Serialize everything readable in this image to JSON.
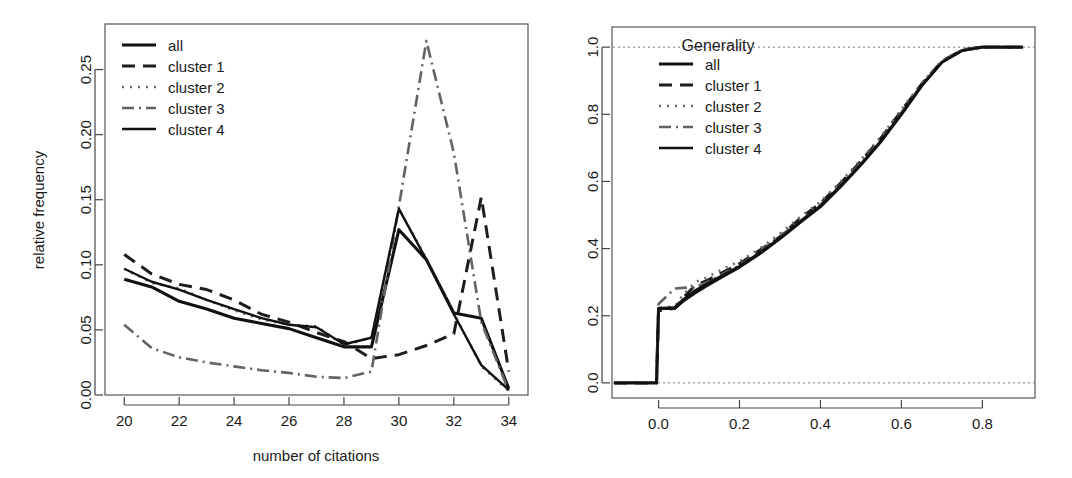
{
  "figure": {
    "background": "#ffffff",
    "panel_count": 2
  },
  "chart_data": [
    {
      "id": "left-panel",
      "type": "line",
      "title": "",
      "xlabel": "number of citations",
      "ylabel": "relative frequency",
      "xlim": [
        19.3,
        34.7
      ],
      "ylim": [
        0.0,
        0.285
      ],
      "xticks": [
        20,
        22,
        24,
        26,
        28,
        30,
        32,
        34
      ],
      "xtick_labels": [
        "20",
        "22",
        "24",
        "26",
        "28",
        "30",
        "32",
        "34"
      ],
      "yticks": [
        0.0,
        0.05,
        0.1,
        0.15,
        0.2,
        0.25
      ],
      "ytick_labels": [
        "0.00",
        "0.05",
        "0.10",
        "0.15",
        "0.20",
        "0.25"
      ],
      "grid": false,
      "legend_position": "top-left",
      "x": [
        20,
        21,
        22,
        23,
        24,
        25,
        26,
        27,
        28,
        29,
        30,
        31,
        32,
        33,
        34
      ],
      "series": [
        {
          "name": "all",
          "style": "solid",
          "color": "#111111",
          "values": [
            0.089,
            0.083,
            0.072,
            0.066,
            0.059,
            0.055,
            0.051,
            0.044,
            0.037,
            0.037,
            0.127,
            0.104,
            0.063,
            0.059,
            0.005
          ]
        },
        {
          "name": "cluster 1",
          "style": "dashed",
          "color": "#1d1d1d",
          "values": [
            0.108,
            0.093,
            0.085,
            0.081,
            0.073,
            0.062,
            0.056,
            0.048,
            0.041,
            0.028,
            0.031,
            0.038,
            0.047,
            0.152,
            0.018
          ]
        },
        {
          "name": "cluster 2",
          "style": "dotted",
          "color": "#6a6a6a",
          "values": [
            0.097,
            0.086,
            0.082,
            0.073,
            0.065,
            0.058,
            0.054,
            0.053,
            0.038,
            0.044,
            0.143,
            0.105,
            0.063,
            0.022,
            0.003
          ]
        },
        {
          "name": "cluster 3",
          "style": "dashdot",
          "color": "#636363",
          "values": [
            0.054,
            0.036,
            0.029,
            0.025,
            0.022,
            0.019,
            0.017,
            0.014,
            0.013,
            0.018,
            0.145,
            0.272,
            0.186,
            0.056,
            0.003
          ]
        },
        {
          "name": "cluster 4",
          "style": "solid-thin",
          "color": "#111111",
          "values": [
            0.097,
            0.087,
            0.081,
            0.073,
            0.066,
            0.059,
            0.054,
            0.052,
            0.039,
            0.044,
            0.143,
            0.104,
            0.062,
            0.023,
            0.004
          ]
        }
      ],
      "legend": [
        {
          "label": "all",
          "style": "solid"
        },
        {
          "label": "cluster 1",
          "style": "dashed"
        },
        {
          "label": "cluster 2",
          "style": "dotted"
        },
        {
          "label": "cluster 3",
          "style": "dashdot"
        },
        {
          "label": "cluster 4",
          "style": "solid-thin"
        }
      ]
    },
    {
      "id": "right-panel",
      "type": "line",
      "title": "Generality",
      "xlabel": "",
      "ylabel": "",
      "xlim": [
        -0.115,
        0.93
      ],
      "ylim": [
        -0.045,
        1.06
      ],
      "xticks": [
        0.0,
        0.2,
        0.4,
        0.6,
        0.8
      ],
      "xtick_labels": [
        "0.0",
        "0.2",
        "0.4",
        "0.6",
        "0.8"
      ],
      "yticks": [
        0.0,
        0.2,
        0.4,
        0.6,
        0.8,
        1.0
      ],
      "ytick_labels": [
        "0.0",
        "0.2",
        "0.4",
        "0.6",
        "0.8",
        "1.0"
      ],
      "grid": false,
      "reference_lines": [
        0.0,
        1.0
      ],
      "legend_position": "top-left",
      "x": [
        -0.11,
        -0.005,
        0.0,
        0.04,
        0.06,
        0.09,
        0.12,
        0.16,
        0.2,
        0.25,
        0.3,
        0.35,
        0.4,
        0.45,
        0.5,
        0.55,
        0.6,
        0.65,
        0.7,
        0.75,
        0.8,
        0.9
      ],
      "series": [
        {
          "name": "all",
          "style": "solid",
          "color": "#111111",
          "values": [
            0.0,
            0.0,
            0.222,
            0.222,
            0.243,
            0.268,
            0.29,
            0.318,
            0.345,
            0.385,
            0.43,
            0.478,
            0.525,
            0.585,
            0.65,
            0.72,
            0.8,
            0.885,
            0.955,
            0.99,
            1.0,
            1.0
          ]
        },
        {
          "name": "cluster 1",
          "style": "dashed",
          "color": "#1d1d1d",
          "values": [
            0.0,
            0.0,
            0.215,
            0.222,
            0.252,
            0.29,
            0.305,
            0.33,
            0.355,
            0.395,
            0.435,
            0.49,
            0.535,
            0.595,
            0.66,
            0.73,
            0.81,
            0.89,
            0.958,
            0.992,
            1.0,
            1.0
          ]
        },
        {
          "name": "cluster 2",
          "style": "dotted",
          "color": "#6a6a6a",
          "values": [
            0.0,
            0.0,
            0.225,
            0.228,
            0.262,
            0.3,
            0.315,
            0.34,
            0.362,
            0.4,
            0.445,
            0.495,
            0.54,
            0.6,
            0.665,
            0.735,
            0.815,
            0.893,
            0.96,
            0.993,
            1.0,
            1.0
          ]
        },
        {
          "name": "cluster 3",
          "style": "dashdot",
          "color": "#636363",
          "values": [
            0.0,
            0.0,
            0.235,
            0.281,
            0.283,
            0.285,
            0.3,
            0.325,
            0.35,
            0.39,
            0.438,
            0.482,
            0.53,
            0.59,
            0.655,
            0.725,
            0.805,
            0.888,
            0.956,
            0.991,
            1.0,
            1.0
          ]
        },
        {
          "name": "cluster 4",
          "style": "solid-thin",
          "color": "#111111",
          "values": [
            0.0,
            0.0,
            0.222,
            0.225,
            0.248,
            0.275,
            0.296,
            0.322,
            0.348,
            0.388,
            0.432,
            0.48,
            0.528,
            0.588,
            0.652,
            0.722,
            0.802,
            0.886,
            0.955,
            0.99,
            1.0,
            1.0
          ]
        }
      ],
      "legend": [
        {
          "label": "all",
          "style": "solid"
        },
        {
          "label": "cluster 1",
          "style": "dashed"
        },
        {
          "label": "cluster 2",
          "style": "dotted"
        },
        {
          "label": "cluster 3",
          "style": "dashdot"
        },
        {
          "label": "cluster 4",
          "style": "solid-thin"
        }
      ]
    }
  ]
}
